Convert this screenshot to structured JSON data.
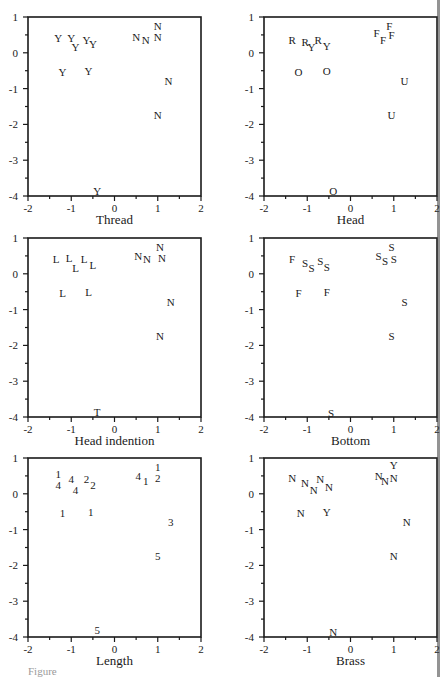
{
  "figure": {
    "caption_fragment": "Figure"
  },
  "chart_data": [
    {
      "type": "scatter",
      "title": "",
      "xlabel": "Thread",
      "ylabel": "",
      "xlim": [
        -2,
        2
      ],
      "ylim": [
        -4,
        1
      ],
      "xticks": [
        "-2",
        "-1",
        "0",
        "1",
        "2"
      ],
      "yticks": [
        "1",
        "0",
        "-1",
        "-2",
        "-3",
        "-4"
      ],
      "grid": false,
      "points": [
        {
          "x": -1.3,
          "y": 0.4,
          "label": "Y"
        },
        {
          "x": -1.0,
          "y": 0.4,
          "label": "Y"
        },
        {
          "x": -0.9,
          "y": 0.15,
          "label": "Y"
        },
        {
          "x": -0.65,
          "y": 0.35,
          "label": "Y"
        },
        {
          "x": -0.5,
          "y": 0.25,
          "label": "Y"
        },
        {
          "x": -1.2,
          "y": -0.55,
          "label": "Y"
        },
        {
          "x": -0.6,
          "y": -0.5,
          "label": "Y"
        },
        {
          "x": 0.5,
          "y": 0.45,
          "label": "N"
        },
        {
          "x": 0.72,
          "y": 0.35,
          "label": "N"
        },
        {
          "x": 1.0,
          "y": 0.75,
          "label": "N"
        },
        {
          "x": 1.0,
          "y": 0.45,
          "label": "N"
        },
        {
          "x": 1.25,
          "y": -0.8,
          "label": "N"
        },
        {
          "x": 1.0,
          "y": -1.75,
          "label": "N"
        },
        {
          "x": -0.4,
          "y": -3.85,
          "label": "Y"
        }
      ]
    },
    {
      "type": "scatter",
      "title": "",
      "xlabel": "Head",
      "ylabel": "",
      "xlim": [
        -2,
        2
      ],
      "ylim": [
        -4,
        1
      ],
      "xticks": [
        "-2",
        "-1",
        "0",
        "1",
        "2"
      ],
      "yticks": [
        "1",
        "0",
        "-1",
        "-2",
        "-3",
        "-4"
      ],
      "grid": false,
      "points": [
        {
          "x": -1.35,
          "y": 0.35,
          "label": "R"
        },
        {
          "x": -1.05,
          "y": 0.3,
          "label": "R"
        },
        {
          "x": -0.9,
          "y": 0.15,
          "label": "Y"
        },
        {
          "x": -0.75,
          "y": 0.35,
          "label": "R"
        },
        {
          "x": -0.55,
          "y": 0.2,
          "label": "Y"
        },
        {
          "x": -1.2,
          "y": -0.55,
          "label": "O"
        },
        {
          "x": -0.55,
          "y": -0.5,
          "label": "O"
        },
        {
          "x": 0.6,
          "y": 0.55,
          "label": "F"
        },
        {
          "x": 0.75,
          "y": 0.35,
          "label": "F"
        },
        {
          "x": 0.9,
          "y": 0.75,
          "label": "F"
        },
        {
          "x": 0.95,
          "y": 0.5,
          "label": "F"
        },
        {
          "x": 1.25,
          "y": -0.8,
          "label": "U"
        },
        {
          "x": 0.95,
          "y": -1.75,
          "label": "U"
        },
        {
          "x": -0.4,
          "y": -3.85,
          "label": "O"
        }
      ]
    },
    {
      "type": "scatter",
      "title": "",
      "xlabel": "Head indention",
      "ylabel": "",
      "xlim": [
        -2,
        2
      ],
      "ylim": [
        -4,
        1
      ],
      "xticks": [
        "-2",
        "-1",
        "0",
        "1",
        "2"
      ],
      "yticks": [
        "1",
        "0",
        "-1",
        "-2",
        "-3",
        "-4"
      ],
      "grid": false,
      "points": [
        {
          "x": -1.35,
          "y": 0.4,
          "label": "L"
        },
        {
          "x": -1.05,
          "y": 0.45,
          "label": "L"
        },
        {
          "x": -0.9,
          "y": 0.15,
          "label": "L"
        },
        {
          "x": -0.7,
          "y": 0.4,
          "label": "L"
        },
        {
          "x": -0.5,
          "y": 0.25,
          "label": "L"
        },
        {
          "x": -1.2,
          "y": -0.55,
          "label": "L"
        },
        {
          "x": -0.6,
          "y": -0.5,
          "label": "L"
        },
        {
          "x": 0.55,
          "y": 0.5,
          "label": "N"
        },
        {
          "x": 0.75,
          "y": 0.4,
          "label": "N"
        },
        {
          "x": 1.05,
          "y": 0.75,
          "label": "N"
        },
        {
          "x": 1.1,
          "y": 0.45,
          "label": "N"
        },
        {
          "x": 1.3,
          "y": -0.8,
          "label": "N"
        },
        {
          "x": 1.05,
          "y": -1.75,
          "label": "N"
        },
        {
          "x": -0.4,
          "y": -3.85,
          "label": "T"
        }
      ]
    },
    {
      "type": "scatter",
      "title": "",
      "xlabel": "Bottom",
      "ylabel": "",
      "xlim": [
        -2,
        2
      ],
      "ylim": [
        -4,
        1
      ],
      "xticks": [
        "-2",
        "-1",
        "0",
        "1",
        "2"
      ],
      "yticks": [
        "1",
        "0",
        "-1",
        "-2",
        "-3",
        "-4"
      ],
      "grid": false,
      "points": [
        {
          "x": -1.35,
          "y": 0.4,
          "label": "F"
        },
        {
          "x": -1.05,
          "y": 0.3,
          "label": "S"
        },
        {
          "x": -0.9,
          "y": 0.15,
          "label": "S"
        },
        {
          "x": -0.7,
          "y": 0.35,
          "label": "S"
        },
        {
          "x": -0.55,
          "y": 0.2,
          "label": "S"
        },
        {
          "x": -1.2,
          "y": -0.55,
          "label": "F"
        },
        {
          "x": -0.55,
          "y": -0.5,
          "label": "F"
        },
        {
          "x": 0.65,
          "y": 0.5,
          "label": "S"
        },
        {
          "x": 0.8,
          "y": 0.35,
          "label": "S"
        },
        {
          "x": 0.95,
          "y": 0.75,
          "label": "S"
        },
        {
          "x": 1.0,
          "y": 0.4,
          "label": "S"
        },
        {
          "x": 1.25,
          "y": -0.8,
          "label": "S"
        },
        {
          "x": 0.95,
          "y": -1.75,
          "label": "S"
        },
        {
          "x": -0.45,
          "y": -3.9,
          "label": "S"
        }
      ]
    },
    {
      "type": "scatter",
      "title": "",
      "xlabel": "Length",
      "ylabel": "",
      "xlim": [
        -2,
        2
      ],
      "ylim": [
        -4,
        1
      ],
      "xticks": [
        "-2",
        "-1",
        "0",
        "1",
        "2"
      ],
      "yticks": [
        "1",
        "0",
        "-1",
        "-2",
        "-3",
        "-4"
      ],
      "grid": false,
      "points": [
        {
          "x": -1.3,
          "y": 0.55,
          "label": "1"
        },
        {
          "x": -1.3,
          "y": 0.25,
          "label": "4"
        },
        {
          "x": -1.0,
          "y": 0.4,
          "label": "4"
        },
        {
          "x": -0.9,
          "y": 0.1,
          "label": "4"
        },
        {
          "x": -0.65,
          "y": 0.4,
          "label": "2"
        },
        {
          "x": -0.5,
          "y": 0.25,
          "label": "2"
        },
        {
          "x": -1.2,
          "y": -0.55,
          "label": "1"
        },
        {
          "x": -0.55,
          "y": -0.5,
          "label": "1"
        },
        {
          "x": 0.55,
          "y": 0.5,
          "label": "4"
        },
        {
          "x": 0.72,
          "y": 0.35,
          "label": "1"
        },
        {
          "x": 1.0,
          "y": 0.75,
          "label": "1"
        },
        {
          "x": 1.0,
          "y": 0.45,
          "label": "2"
        },
        {
          "x": 1.3,
          "y": -0.8,
          "label": "3"
        },
        {
          "x": 1.0,
          "y": -1.75,
          "label": "5"
        },
        {
          "x": -0.4,
          "y": -3.8,
          "label": "5"
        }
      ]
    },
    {
      "type": "scatter",
      "title": "",
      "xlabel": "Brass",
      "ylabel": "",
      "xlim": [
        -2,
        2
      ],
      "ylim": [
        -4,
        1
      ],
      "xticks": [
        "-2",
        "-1",
        "0",
        "1",
        "2"
      ],
      "yticks": [
        "1",
        "0",
        "-1",
        "-2",
        "-3",
        "-4"
      ],
      "grid": false,
      "points": [
        {
          "x": -1.35,
          "y": 0.45,
          "label": "N"
        },
        {
          "x": -1.05,
          "y": 0.3,
          "label": "N"
        },
        {
          "x": -0.85,
          "y": 0.1,
          "label": "N"
        },
        {
          "x": -0.7,
          "y": 0.4,
          "label": "N"
        },
        {
          "x": -0.5,
          "y": 0.2,
          "label": "N"
        },
        {
          "x": -1.15,
          "y": -0.55,
          "label": "N"
        },
        {
          "x": -0.55,
          "y": -0.5,
          "label": "Y"
        },
        {
          "x": 0.65,
          "y": 0.5,
          "label": "N"
        },
        {
          "x": 0.8,
          "y": 0.35,
          "label": "N"
        },
        {
          "x": 1.0,
          "y": 0.8,
          "label": "Y"
        },
        {
          "x": 1.0,
          "y": 0.45,
          "label": "N"
        },
        {
          "x": 1.3,
          "y": -0.8,
          "label": "N"
        },
        {
          "x": 1.0,
          "y": -1.75,
          "label": "N"
        },
        {
          "x": -0.4,
          "y": -3.85,
          "label": "N"
        }
      ]
    }
  ]
}
